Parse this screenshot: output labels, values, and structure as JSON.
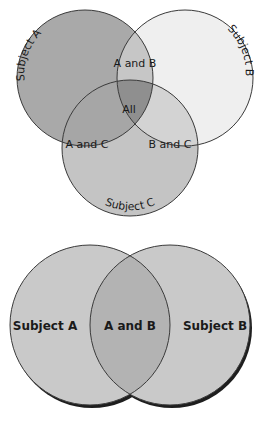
{
  "diagrams": [
    {
      "type": "venn-3",
      "sets": [
        {
          "id": "A",
          "label": "Subject A",
          "cx": 85,
          "cy": 78,
          "r": 68,
          "fill": "#a9a9a9"
        },
        {
          "id": "B",
          "label": "Subject B",
          "cx": 185,
          "cy": 78,
          "r": 68,
          "fill": "#efefef"
        },
        {
          "id": "C",
          "label": "Subject C",
          "cx": 130,
          "cy": 148,
          "r": 68,
          "fill": "#c4c4c4"
        }
      ],
      "intersections": [
        {
          "id": "AB",
          "label": "A and B",
          "fill": "#c6c6c6"
        },
        {
          "id": "AC",
          "label": "A and C",
          "fill": "#a6a6a6"
        },
        {
          "id": "BC",
          "label": "B and C",
          "fill": "#d3d3d3"
        },
        {
          "id": "ABC",
          "label": "All",
          "fill": "#8f8f8f"
        }
      ]
    },
    {
      "type": "venn-2",
      "sets": [
        {
          "id": "A",
          "label": "Subject A",
          "cx": 90,
          "cy": 325,
          "r": 80,
          "fill": "#c9c9c9"
        },
        {
          "id": "B",
          "label": "Subject B",
          "cx": 170,
          "cy": 325,
          "r": 80,
          "fill": "#c9c9c9"
        }
      ],
      "intersections": [
        {
          "id": "AB",
          "label": "A and B",
          "fill": "#b3b3b3"
        }
      ]
    }
  ],
  "colors": {
    "stroke": "#3a3a3a",
    "shadow": "#1e1e1e",
    "background": "#ffffff"
  }
}
